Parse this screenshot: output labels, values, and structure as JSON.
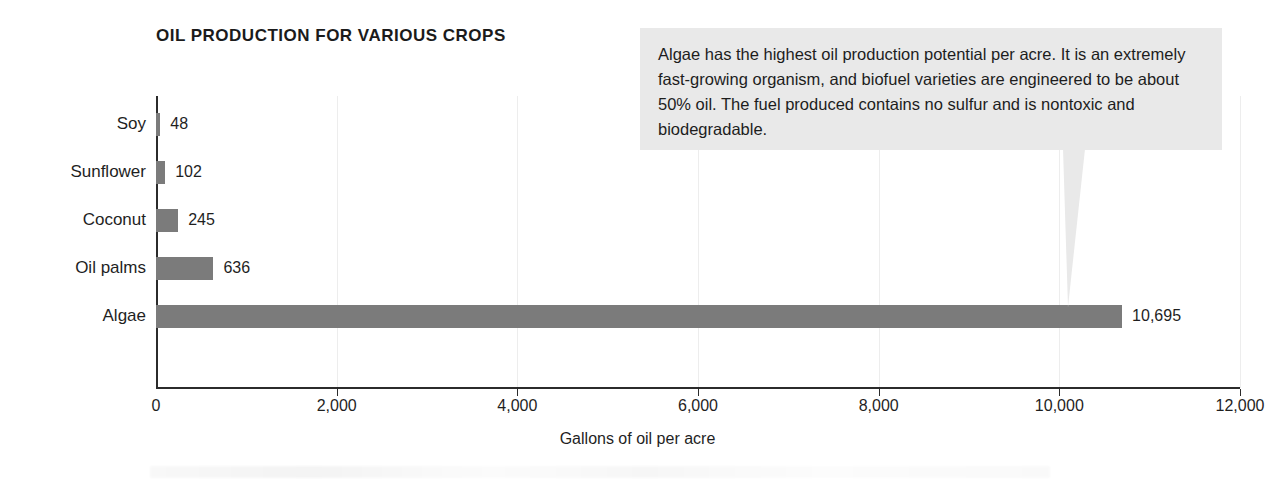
{
  "chart_data": {
    "type": "bar",
    "orientation": "horizontal",
    "title": "OIL PRODUCTION FOR VARIOUS CROPS",
    "categories": [
      "Soy",
      "Sunflower",
      "Coconut",
      "Oil palms",
      "Algae"
    ],
    "values": [
      48,
      102,
      245,
      636,
      10695
    ],
    "value_labels": [
      "48",
      "102",
      "245",
      "636",
      "10,695"
    ],
    "xlabel": "Gallons of oil per acre",
    "ylabel": "",
    "xlim": [
      0,
      12000
    ],
    "xticks": [
      0,
      2000,
      4000,
      6000,
      8000,
      10000,
      12000
    ],
    "xtick_labels": [
      "0",
      "2,000",
      "4,000",
      "6,000",
      "8,000",
      "10,000",
      "12,000"
    ],
    "grid": "faint-vertical",
    "legend": "none",
    "bar_color": "#7b7b7b",
    "axis_color": "#2b2b2b"
  },
  "callout": {
    "text": "Algae has the highest oil production potential per acre. It is an extremely fast-growing organism, and biofuel varieties are engineered to be about 50% oil. The fuel produced contains no sulfur and is nontoxic and biodegradable.",
    "background_color": "#e9e9e9",
    "points_at": "Algae"
  }
}
